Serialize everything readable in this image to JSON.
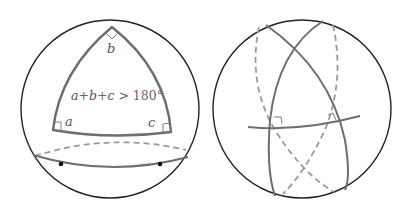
{
  "figure": {
    "left_panel": {
      "title": "Spherical triangle",
      "vertex_labels": {
        "a": "a",
        "b": "b",
        "c": "c"
      },
      "formula_parts": [
        "a",
        "+",
        "b",
        "+",
        "c",
        " > 180°"
      ],
      "formula": "a+b+c > 180°",
      "right_angle_markers": 3,
      "equator_points": 2
    },
    "right_panel": {
      "title": "Great circles perpendicular to a common line",
      "right_angle_markers": 2
    },
    "colors": {
      "sphere_outline": "#222222",
      "great_circle": "#6e6e6e",
      "hidden_arc": "#9a9a9a",
      "text": "#5a5a5a",
      "point": "#111111"
    }
  }
}
